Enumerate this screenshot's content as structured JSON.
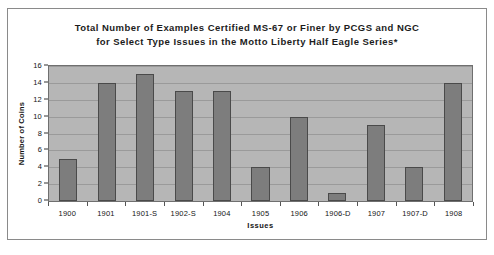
{
  "chart_data": {
    "type": "bar",
    "title": "Total Number of Examples Certified MS-67 or Finer by PCGS and NGC for Select Type Issues in the Motto Liberty Half Eagle Series*",
    "title_lines": [
      "Total Number of Examples Certified MS-67 or Finer by PCGS and NGC",
      "for Select Type Issues in the Motto Liberty Half Eagle Series*"
    ],
    "xlabel": "Issues",
    "ylabel": "Number of Coins",
    "categories": [
      "1900",
      "1901",
      "1901-S",
      "1902-S",
      "1904",
      "1905",
      "1906",
      "1906-D",
      "1907",
      "1907-D",
      "1908"
    ],
    "values": [
      5,
      14,
      15,
      13,
      13,
      4,
      10,
      1,
      9,
      4,
      14
    ],
    "ylim": [
      0,
      16
    ],
    "ytick_step": 2,
    "yticks": [
      "16",
      "14",
      "12",
      "10",
      "8",
      "6",
      "4",
      "2",
      "0"
    ],
    "grid": true,
    "legend": "none",
    "colors": {
      "bar_fill": "#7d7d7d",
      "bar_border": "#4a4a4a",
      "plot_background": "#b6b6b6",
      "gridline": "#9a9a9a",
      "frame_border": "#8a8a8a",
      "text": "#141414",
      "page_background": "#ffffff"
    }
  }
}
